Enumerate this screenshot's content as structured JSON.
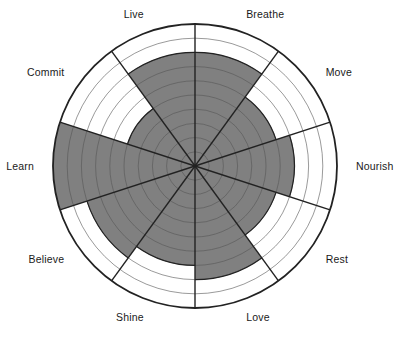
{
  "chart_data": {
    "type": "radar",
    "title": "",
    "subtitle": "",
    "xlabel": "",
    "ylabel": "",
    "grid": true,
    "legend_position": "none",
    "rings": 10,
    "scale_min": 0,
    "scale_max": 10,
    "categories": [
      "Breathe",
      "Move",
      "Nourish",
      "Rest",
      "Love",
      "Shine",
      "Believe",
      "Learn",
      "Commit",
      "Live"
    ],
    "values": [
      8,
      6,
      7,
      6,
      8,
      7,
      8,
      10,
      5,
      8
    ],
    "series": [
      {
        "name": "Current",
        "values": [
          8,
          6,
          7,
          6,
          8,
          7,
          8,
          10,
          5,
          8
        ]
      }
    ],
    "sectors": [
      {
        "label": "Breathe",
        "value": 8,
        "start_angle": 0,
        "end_angle": 36,
        "label_angle": 18
      },
      {
        "label": "Move",
        "value": 6,
        "start_angle": 36,
        "end_angle": 72,
        "label_angle": 54
      },
      {
        "label": "Nourish",
        "value": 7,
        "start_angle": 72,
        "end_angle": 108,
        "label_angle": 90
      },
      {
        "label": "Rest",
        "value": 6,
        "start_angle": 108,
        "end_angle": 144,
        "label_angle": 126
      },
      {
        "label": "Love",
        "value": 8,
        "start_angle": 144,
        "end_angle": 180,
        "label_angle": 162
      },
      {
        "label": "Shine",
        "value": 7,
        "start_angle": 180,
        "end_angle": 216,
        "label_angle": 198
      },
      {
        "label": "Believe",
        "value": 8,
        "start_angle": 216,
        "end_angle": 252,
        "label_angle": 234
      },
      {
        "label": "Learn",
        "value": 10,
        "start_angle": 252,
        "end_angle": 288,
        "label_angle": 270
      },
      {
        "label": "Commit",
        "value": 5,
        "start_angle": 288,
        "end_angle": 324,
        "label_angle": 306
      },
      {
        "label": "Live",
        "value": 8,
        "start_angle": 324,
        "end_angle": 360,
        "label_angle": 342
      }
    ]
  },
  "colors": {
    "fill": "#808080",
    "background": "#ffffff",
    "outline": "#222222",
    "gridline": "#555555",
    "label_text": "#1a1a1a"
  },
  "geometry": {
    "center_x": 195,
    "center_y": 166,
    "radius": 142
  }
}
